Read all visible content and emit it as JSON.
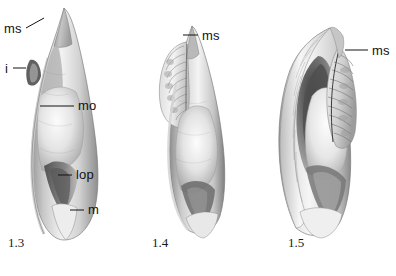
{
  "plate": {
    "background_color": "#ffffff",
    "ink_color": "#121212",
    "description": "Grayscale scientific line-and-wash illustration plate of three elongate specimens shown in successive views, with leader-line abbreviations."
  },
  "figures": [
    {
      "number": "1.3",
      "number_x": 8,
      "number_y": 236,
      "labels": [
        {
          "text": "ms",
          "x": 4,
          "y": 22,
          "leader": {
            "x1": 26,
            "y1": 28,
            "x2": 44,
            "y2": 18
          }
        },
        {
          "text": "i",
          "x": 5,
          "y": 62,
          "leader": {
            "x1": 13,
            "y1": 68,
            "x2": 26,
            "y2": 68
          }
        },
        {
          "text": "mo",
          "x": 78,
          "y": 99,
          "leader": {
            "x1": 40,
            "y1": 106,
            "x2": 74,
            "y2": 106
          }
        },
        {
          "text": "lop",
          "x": 76,
          "y": 168,
          "leader": {
            "x1": 58,
            "y1": 175,
            "x2": 72,
            "y2": 175
          }
        },
        {
          "text": "m",
          "x": 88,
          "y": 203,
          "leader": {
            "x1": 70,
            "y1": 210,
            "x2": 84,
            "y2": 210
          }
        }
      ]
    },
    {
      "number": "1.4",
      "number_x": 152,
      "number_y": 236,
      "labels": [
        {
          "text": "ms",
          "x": 202,
          "y": 29,
          "leader": {
            "x1": 183,
            "y1": 35,
            "x2": 198,
            "y2": 35
          }
        }
      ]
    },
    {
      "number": "1.5",
      "number_x": 288,
      "number_y": 236,
      "labels": [
        {
          "text": "ms",
          "x": 372,
          "y": 44,
          "leader": {
            "x1": 345,
            "y1": 50,
            "x2": 368,
            "y2": 50
          }
        }
      ]
    }
  ],
  "abbreviations": {
    "ms": "ms",
    "i": "i",
    "mo": "mo",
    "lop": "lop",
    "m": "m"
  }
}
